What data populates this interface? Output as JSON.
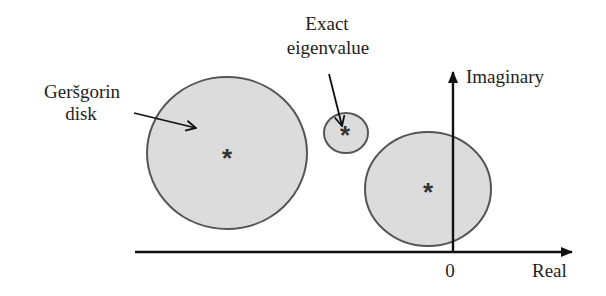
{
  "figure": {
    "colors": {
      "disk_fill": "#dcdcdc",
      "disk_stroke": "#555555",
      "axis": "#111111",
      "text": "#1e1e1e",
      "background": "#ffffff"
    }
  },
  "labels": {
    "gershgorin_line1": "Geršgorin",
    "gershgorin_line2": "disk",
    "eigen_line1": "Exact",
    "eigen_line2": "eigenvalue",
    "imaginary_axis": "Imaginary",
    "real_axis": "Real",
    "origin": "0"
  },
  "markers": {
    "eigenvalue_symbol": "*"
  },
  "disks": [
    {
      "name": "large-left-disk",
      "cx": 227,
      "cy": 153,
      "rx": 80,
      "ry": 76,
      "center_marker": "*"
    },
    {
      "name": "small-middle-disk",
      "cx": 346,
      "cy": 133,
      "rx": 22,
      "ry": 20,
      "center_marker": "*"
    },
    {
      "name": "right-disk-at-origin",
      "cx": 428,
      "cy": 189,
      "rx": 63,
      "ry": 57,
      "center_marker": "*"
    }
  ],
  "axes": {
    "real": {
      "x_start": 135,
      "x_end": 572,
      "y": 252
    },
    "imaginary": {
      "x": 453,
      "y_start": 252,
      "y_end": 72
    }
  }
}
